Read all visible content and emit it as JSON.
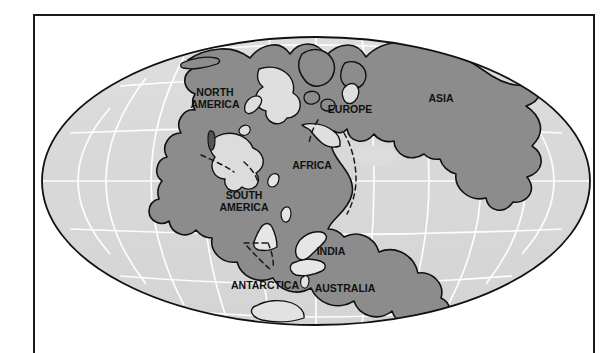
{
  "figure": {
    "projection": "mollweide-oval",
    "frame": {
      "style": "thin-black-rule",
      "sides": "left-top-right"
    }
  },
  "colors": {
    "land_fill": "#8c8c8c",
    "ocean_fill": "#d9d9d9",
    "ocean_fill_light": "#e2e2e2",
    "coastline": "#111111",
    "graticule": "#ffffff",
    "rift_dash": "#1a1a1a",
    "frame": "#1a1a1a",
    "page_background": "#ffffff",
    "label_text": "#111111"
  },
  "map": {
    "labels": [
      {
        "id": "north-america",
        "text": "NORTH",
        "x": 215,
        "y": 93,
        "size": 10.5
      },
      {
        "id": "north-america-2",
        "text": "AMERICA",
        "x": 215,
        "y": 105,
        "size": 10.5
      },
      {
        "id": "south-america",
        "text": "SOUTH",
        "x": 244,
        "y": 196,
        "size": 10.5
      },
      {
        "id": "south-america-2",
        "text": "AMERICA",
        "x": 244,
        "y": 208,
        "size": 10.5
      },
      {
        "id": "africa",
        "text": "AFRICA",
        "x": 312,
        "y": 166,
        "size": 10.5
      },
      {
        "id": "europe",
        "text": "EUROPE",
        "x": 350,
        "y": 110,
        "size": 10.5
      },
      {
        "id": "asia",
        "text": "ASIA",
        "x": 441,
        "y": 99,
        "size": 10.5
      },
      {
        "id": "india",
        "text": "INDIA",
        "x": 331,
        "y": 252,
        "size": 10.5
      },
      {
        "id": "australia",
        "text": "AUSTRALIA",
        "x": 345,
        "y": 289,
        "size": 10.5
      },
      {
        "id": "antarctica",
        "text": "ANTARCTICA",
        "x": 265,
        "y": 286,
        "size": 10.5
      }
    ],
    "continents": [
      "north-america",
      "south-america",
      "africa",
      "europe",
      "asia",
      "india",
      "australia",
      "antarctica"
    ],
    "graticule": {
      "meridians": 11,
      "parallels": 7,
      "line_color": "#ffffff",
      "line_width": 1.6
    },
    "ellipse": {
      "cx": 316,
      "cy": 181,
      "rx": 274,
      "ry": 144
    }
  }
}
